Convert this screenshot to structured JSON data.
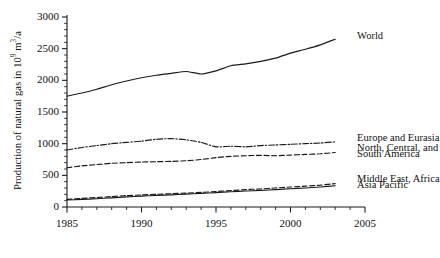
{
  "chart_data": {
    "type": "line",
    "title": "",
    "xlabel": "",
    "ylabel": "Production of natural gas in 10⁹ m³/a",
    "ylabel_parts": {
      "prefix": "Production of natural gas in 10",
      "exponent": "9",
      "suffix": " m",
      "exponent2": "3",
      "suffix2": "/a"
    },
    "xlim": [
      1985,
      2005
    ],
    "ylim": [
      0,
      3000
    ],
    "grid": false,
    "legend_position": "right-inline",
    "x_ticks_major": [
      1985,
      1990,
      1995,
      2000,
      2005
    ],
    "x_tick_labels": [
      "1985",
      "1990",
      "1995",
      "2000",
      "2005"
    ],
    "x_minor_step": 1,
    "y_ticks_major": [
      0,
      500,
      1000,
      1500,
      2000,
      2500,
      3000
    ],
    "y_tick_labels": [
      "0",
      "500",
      "1000",
      "1500",
      "2000",
      "2500",
      "3000"
    ],
    "y_minor_step": 100,
    "x": [
      1985,
      1986,
      1987,
      1988,
      1989,
      1990,
      1991,
      1992,
      1993,
      1994,
      1995,
      1996,
      1997,
      1998,
      1999,
      2000,
      2001,
      2002,
      2003
    ],
    "series": [
      {
        "name": "World",
        "label": "World",
        "style": "solid",
        "color": "#1a1a1a",
        "values": [
          1750,
          1800,
          1860,
          1930,
          1990,
          2040,
          2080,
          2110,
          2140,
          2100,
          2150,
          2230,
          2260,
          2300,
          2350,
          2430,
          2490,
          2560,
          2650
        ]
      },
      {
        "name": "Europe and Eurasia",
        "label": "Europe and Eurasia",
        "style": "dash-dot",
        "color": "#1a1a1a",
        "values": [
          900,
          940,
          970,
          1000,
          1020,
          1040,
          1070,
          1080,
          1060,
          1020,
          950,
          960,
          950,
          970,
          980,
          990,
          1000,
          1010,
          1030
        ]
      },
      {
        "name": "North, Central, and South America",
        "label": "North, Central, and\nSouth America",
        "style": "dashed",
        "color": "#1a1a1a",
        "values": [
          620,
          650,
          670,
          690,
          700,
          710,
          715,
          720,
          730,
          750,
          780,
          800,
          810,
          815,
          810,
          820,
          830,
          840,
          860
        ]
      },
      {
        "name": "Middle East, Africa",
        "label": "Middle East, Africa",
        "style": "dashed",
        "color": "#1a1a1a",
        "values": [
          120,
          135,
          150,
          165,
          180,
          190,
          200,
          210,
          220,
          230,
          245,
          260,
          275,
          285,
          300,
          315,
          330,
          345,
          370
        ]
      },
      {
        "name": "Asia Pacific",
        "label": "Asia Pacific",
        "style": "solid",
        "color": "#1a1a1a",
        "values": [
          110,
          120,
          130,
          145,
          160,
          172,
          182,
          192,
          203,
          215,
          228,
          240,
          252,
          262,
          275,
          288,
          300,
          315,
          335
        ]
      }
    ],
    "annotations": [
      {
        "text": "World",
        "x": 2004.2,
        "y": 2700
      },
      {
        "text": "Europe and Eurasia",
        "x": 2004.2,
        "y": 1090
      },
      {
        "text": "North, Central, and",
        "x": 2004.2,
        "y": 930
      },
      {
        "text": "South America",
        "x": 2004.2,
        "y": 840
      },
      {
        "text": "Middle East, Africa",
        "x": 2004.2,
        "y": 440
      },
      {
        "text": "Asia Pacific",
        "x": 2004.2,
        "y": 350
      }
    ]
  },
  "caption": {
    "text": ""
  }
}
